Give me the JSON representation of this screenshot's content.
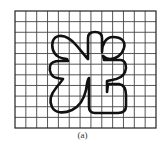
{
  "figure": {
    "caption": "(a)",
    "grid": {
      "columns": 13,
      "rows": 11,
      "x0": 15,
      "y0": 11,
      "x1": 156,
      "y1": 128,
      "line_color": "#444444",
      "border_color": "#222222"
    },
    "shape": {
      "description": "closed outline of the Chinese character 光 drawn over grid",
      "stroke_color": "#111111",
      "stroke_width": 2.6,
      "fill": "none"
    },
    "background_color": "#ffffff"
  }
}
